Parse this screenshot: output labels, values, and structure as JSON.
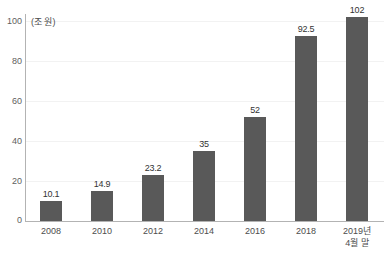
{
  "chart_data": {
    "type": "bar",
    "title": "",
    "subtitle": "",
    "xlabel": "",
    "ylabel": "",
    "unit_label": "(조 원)",
    "categories": [
      "2008",
      "2010",
      "2012",
      "2014",
      "2016",
      "2018",
      "2019년\n4월 말"
    ],
    "values": [
      10.1,
      14.9,
      23.2,
      35,
      52,
      92.5,
      102
    ],
    "value_labels": [
      "10.1",
      "14.9",
      "23.2",
      "35",
      "52",
      "92.5",
      "102"
    ],
    "ylim": [
      0,
      100
    ],
    "yticks": [
      0,
      20,
      40,
      60,
      80,
      100
    ],
    "ytick_labels": [
      "0",
      "20",
      "40",
      "60",
      "80",
      "100"
    ],
    "grid": true,
    "grid_axis": "y",
    "legend": null,
    "legend_position": "none",
    "series": [
      {
        "name": "",
        "values": [
          10.1,
          14.9,
          23.2,
          35,
          52,
          92.5,
          102
        ]
      }
    ],
    "colors": {
      "bar": "#595959",
      "grid": "#f2f2f2",
      "axis": "#b3b3b3",
      "tick_text": "#606060",
      "value_text": "#333333",
      "background": "#ffffff"
    }
  }
}
